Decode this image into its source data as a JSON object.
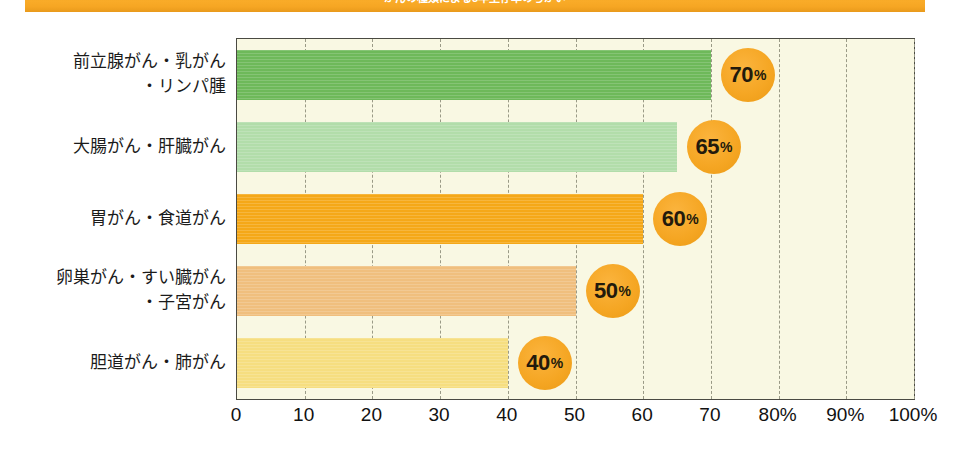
{
  "banner": {
    "text": "がんの種類による5年生存率のちがい",
    "color": "#f5a623"
  },
  "chart_data": {
    "type": "bar",
    "orientation": "horizontal",
    "title": "がんの種類による5年生存率のちがい",
    "xlabel": "",
    "ylabel": "",
    "xlim": [
      0,
      100
    ],
    "grid": true,
    "legend": "none",
    "categories": [
      "前立腺がん・乳がん\n・リンパ腫",
      "大腸がん・肝臓がん",
      "胃がん・食道がん",
      "卵巣がん・すい臓がん\n・子宮がん",
      "胆道がん・肺がん"
    ],
    "values": [
      70,
      65,
      60,
      50,
      40
    ],
    "data_labels": [
      "70%",
      "65%",
      "60%",
      "50%",
      "40%"
    ],
    "bar_colors": [
      "#6eb95a",
      "#b2ddaa",
      "#f5a818",
      "#f0bf7e",
      "#f6de80"
    ],
    "plot_background": "#f9f8e3",
    "xticks": [
      0,
      10,
      20,
      30,
      40,
      50,
      60,
      70,
      80,
      90,
      100
    ],
    "xticklabels": [
      "0",
      "10",
      "20",
      "30",
      "40",
      "50",
      "60",
      "70",
      "80%",
      "90%",
      "100%"
    ]
  }
}
